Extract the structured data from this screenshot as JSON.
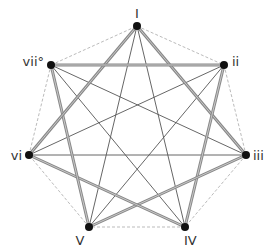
{
  "diagram": {
    "type": "heptagram-chord-graph",
    "colors": {
      "node": "#111111",
      "thick_edge": "#888888",
      "thin_edge": "#555555",
      "dashed_edge": "#bbbbbb",
      "label": "#333333"
    },
    "nodes": [
      {
        "id": "I",
        "label": "I",
        "x": 137,
        "y": 26,
        "lx": 137,
        "ly": 18,
        "anchor": "middle"
      },
      {
        "id": "ii",
        "label": "ii",
        "x": 224,
        "y": 65,
        "lx": 232,
        "ly": 66,
        "anchor": "start"
      },
      {
        "id": "iii",
        "label": "iii",
        "x": 246,
        "y": 155,
        "lx": 253,
        "ly": 160,
        "anchor": "start"
      },
      {
        "id": "IV",
        "label": "IV",
        "x": 185,
        "y": 227,
        "lx": 184,
        "ly": 245,
        "anchor": "start"
      },
      {
        "id": "V",
        "label": "V",
        "x": 89,
        "y": 227,
        "lx": 80,
        "ly": 245,
        "anchor": "middle"
      },
      {
        "id": "vi",
        "label": "vi",
        "x": 29,
        "y": 155,
        "lx": 22,
        "ly": 160,
        "anchor": "end"
      },
      {
        "id": "vii",
        "label": "vii°",
        "x": 51,
        "y": 65,
        "lx": 44,
        "ly": 66,
        "anchor": "end"
      }
    ],
    "dashed_edges": [
      [
        "I",
        "ii"
      ],
      [
        "ii",
        "iii"
      ],
      [
        "iii",
        "IV"
      ],
      [
        "IV",
        "V"
      ],
      [
        "V",
        "vi"
      ],
      [
        "vi",
        "vii"
      ],
      [
        "vii",
        "I"
      ]
    ],
    "thick_edges": [
      [
        "I",
        "iii"
      ],
      [
        "ii",
        "IV"
      ],
      [
        "iii",
        "V"
      ],
      [
        "IV",
        "vi"
      ],
      [
        "V",
        "vii"
      ],
      [
        "vi",
        "I"
      ],
      [
        "vii",
        "ii"
      ]
    ],
    "thin_edges": [
      [
        "I",
        "IV"
      ],
      [
        "ii",
        "V"
      ],
      [
        "iii",
        "vi"
      ],
      [
        "IV",
        "vii"
      ],
      [
        "V",
        "I"
      ],
      [
        "vi",
        "ii"
      ],
      [
        "vii",
        "iii"
      ]
    ]
  }
}
